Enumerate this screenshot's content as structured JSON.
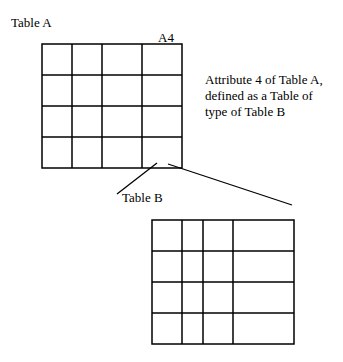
{
  "labels": {
    "table_a": "Table A",
    "a4": "A4",
    "annotation_line1": "Attribute 4 of Table A,",
    "annotation_line2": "defined as a Table of",
    "annotation_line3": "type of Table B",
    "table_b": "Table B"
  },
  "table_a": {
    "rows": 4,
    "cols": 4,
    "col_x": [
      42,
      72,
      102,
      142,
      182
    ],
    "row_y": [
      44,
      75,
      106,
      137,
      168
    ]
  },
  "table_b": {
    "rows": 4,
    "cols": 4,
    "col_x": [
      152,
      182,
      203,
      233,
      294
    ],
    "row_y": [
      220,
      251,
      282,
      313,
      344
    ]
  },
  "colors": {
    "line": "#000000",
    "background": "#ffffff"
  }
}
